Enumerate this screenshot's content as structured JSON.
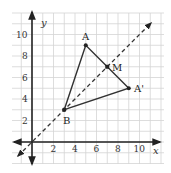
{
  "diagram": {
    "type": "coordinate-plane",
    "axes": {
      "x_label": "x",
      "y_label": "y",
      "x_ticks": [
        "2",
        "4",
        "6",
        "8",
        "10"
      ],
      "y_ticks": [
        "2",
        "4",
        "6",
        "8",
        "10"
      ]
    },
    "points": [
      {
        "name": "A",
        "x": 5,
        "y": 9,
        "label": "A"
      },
      {
        "name": "M",
        "x": 7,
        "y": 7,
        "label": "M"
      },
      {
        "name": "A-prime",
        "x": 9,
        "y": 5,
        "label": "A'"
      },
      {
        "name": "B",
        "x": 3,
        "y": 3,
        "label": "B"
      }
    ],
    "segments": [
      [
        "A",
        "B"
      ],
      [
        "B",
        "A-prime"
      ],
      [
        "A",
        "A-prime"
      ]
    ],
    "dashed_line": {
      "equation": "y = x"
    },
    "colors": {
      "grid": "#d4d4d4",
      "axis": "#222222",
      "line": "#333333"
    }
  }
}
